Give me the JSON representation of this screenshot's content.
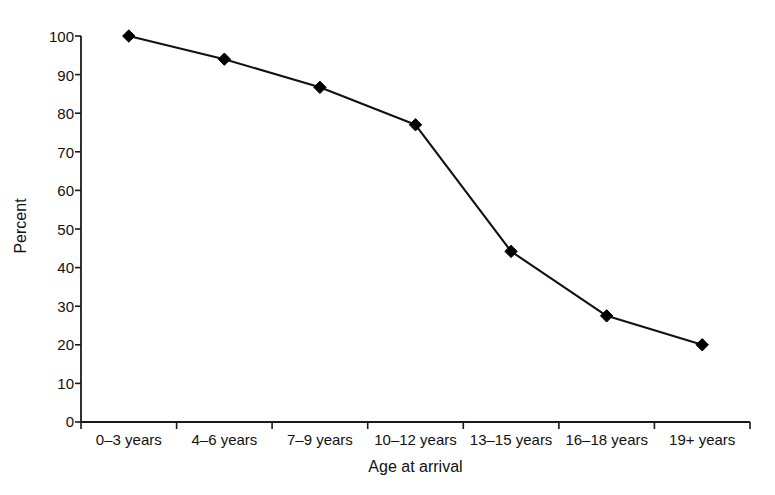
{
  "chart_data": {
    "type": "line",
    "title": "",
    "subtitle": "",
    "xlabel": "Age at arrival",
    "ylabel": "Percent",
    "categories": [
      "0–3 years",
      "4–6 years",
      "7–9 years",
      "10–12 years",
      "13–15 years",
      "16–18 years",
      "19+ years"
    ],
    "values": [
      100,
      94,
      86.7,
      77,
      44.2,
      27.5,
      20
    ],
    "series": [
      {
        "name": "Percent",
        "values": [
          100,
          94,
          86.7,
          77,
          44.2,
          27.5,
          20
        ]
      }
    ],
    "ylim": [
      0,
      100
    ],
    "ytick_values": [
      0,
      10,
      20,
      30,
      40,
      50,
      60,
      70,
      80,
      90,
      100
    ],
    "ytick_labels": [
      "0",
      "10",
      "20",
      "30",
      "40",
      "50",
      "60",
      "70",
      "80",
      "90",
      "100"
    ],
    "grid": false,
    "legend": false,
    "legend_position": "none",
    "marker": "diamond",
    "line_color": "#111111",
    "marker_color": "#000000",
    "background_color": "#ffffff",
    "annotations": []
  }
}
